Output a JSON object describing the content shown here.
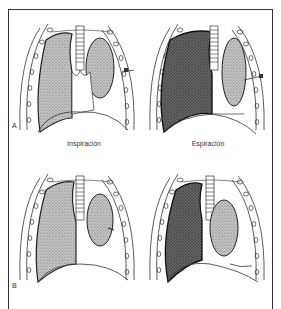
{
  "figure": {
    "panel_labels": [
      "A",
      "B"
    ],
    "captions": {
      "inspiration": "Inspiración",
      "expiration": "Espiración"
    },
    "panels": [
      {
        "id": "A-inspiration",
        "row": "A",
        "phase": "Inspiración",
        "right_lung_shade": "light",
        "mediastinum_shift": "right"
      },
      {
        "id": "A-expiration",
        "row": "A",
        "phase": "Espiración",
        "right_lung_shade": "dark",
        "mediastinum_shift": "left"
      },
      {
        "id": "B-inspiration",
        "row": "B",
        "phase": "Inspiración",
        "right_lung_shade": "light",
        "mediastinum_shift": "none"
      },
      {
        "id": "B-expiration",
        "row": "B",
        "phase": "Espiración",
        "right_lung_shade": "dark",
        "mediastinum_shift": "none"
      }
    ],
    "colors": {
      "line": "#333333",
      "stipple_light": "#9a9a9a",
      "stipple_dark": "#5a5a5a",
      "background": "#ffffff"
    }
  }
}
